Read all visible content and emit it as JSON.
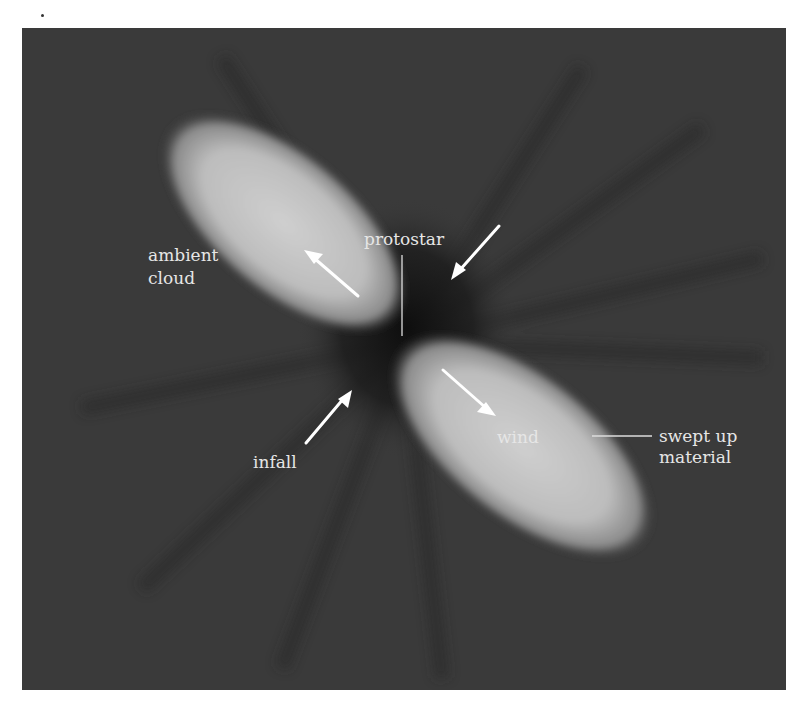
{
  "figure": {
    "background_color": "#3a3a3a",
    "lobe_color": "#c8c8c8",
    "labels": {
      "ambient_cloud_line1": "ambient",
      "ambient_cloud_line2": "cloud",
      "protostar": "protostar",
      "infall": "infall",
      "wind": "wind",
      "swept_up_line1": "swept up",
      "swept_up_line2": "material"
    },
    "arrows": [
      {
        "name": "outflow-arrow-upper",
        "direction": "up-left"
      },
      {
        "name": "infall-arrow-upper-right",
        "direction": "down-left"
      },
      {
        "name": "infall-arrow-lower-left",
        "direction": "up-right"
      },
      {
        "name": "outflow-arrow-lower",
        "direction": "down-right"
      }
    ]
  }
}
